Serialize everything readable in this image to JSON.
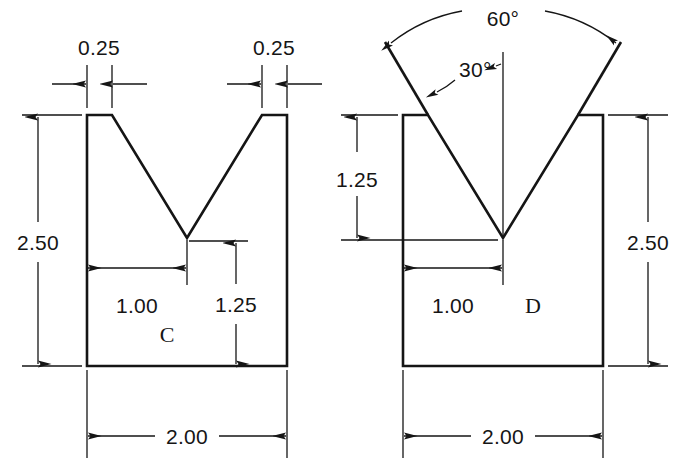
{
  "drawing": {
    "title": "V-Block Section Views C and D",
    "background_color": "#ffffff",
    "line_color": "#151515",
    "units_note": "",
    "figures": [
      {
        "id": "figure-c",
        "label": "C",
        "description": "V-groove block with linear dimensions",
        "dimensions": [
          {
            "name": "top-left-land",
            "value": "0.25",
            "type": "linear",
            "orientation": "horizontal"
          },
          {
            "name": "top-right-land",
            "value": "0.25",
            "type": "linear",
            "orientation": "horizontal"
          },
          {
            "name": "overall-height",
            "value": "2.50",
            "type": "linear",
            "orientation": "vertical"
          },
          {
            "name": "groove-half-width",
            "value": "1.00",
            "type": "linear",
            "orientation": "horizontal"
          },
          {
            "name": "vertex-to-base",
            "value": "1.25",
            "type": "linear",
            "orientation": "vertical"
          },
          {
            "name": "overall-width",
            "value": "2.00",
            "type": "linear",
            "orientation": "horizontal"
          }
        ]
      },
      {
        "id": "figure-d",
        "label": "D",
        "description": "V-groove block with angular dimensions",
        "dimensions": [
          {
            "name": "included-angle",
            "value": "60°",
            "type": "angular"
          },
          {
            "name": "half-angle",
            "value": "30°",
            "type": "angular"
          },
          {
            "name": "groove-depth",
            "value": "1.25",
            "type": "linear",
            "orientation": "vertical"
          },
          {
            "name": "groove-half-width",
            "value": "1.00",
            "type": "linear",
            "orientation": "horizontal"
          },
          {
            "name": "overall-height",
            "value": "2.50",
            "type": "linear",
            "orientation": "vertical"
          },
          {
            "name": "overall-width",
            "value": "2.00",
            "type": "linear",
            "orientation": "horizontal"
          }
        ]
      }
    ],
    "labels": {
      "c_left_land": "0.25",
      "c_right_land": "0.25",
      "c_height": "2.50",
      "c_groove_half_width": "1.00",
      "c_vertex_to_base": "1.25",
      "c_width": "2.00",
      "c_part": "C",
      "d_included_angle": "60°",
      "d_half_angle": "30°",
      "d_groove_depth": "1.25",
      "d_groove_half_width": "1.00",
      "d_height": "2.50",
      "d_width": "2.00",
      "d_part": "D"
    }
  }
}
